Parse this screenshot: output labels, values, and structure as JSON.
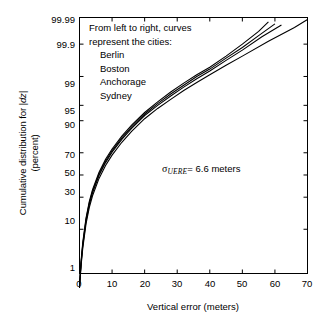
{
  "chart_data": {
    "type": "line",
    "title": "",
    "xlabel": "Vertical error (meters)",
    "ylabel_line1": "Cumulative distribution for |dz|",
    "ylabel_line2": "(percent)",
    "ylabel_italic_part": "|dz|",
    "xlim": [
      0,
      70
    ],
    "xticks": [
      0,
      10,
      20,
      30,
      40,
      50,
      60,
      70
    ],
    "xtick_labels": [
      "0",
      "10",
      "20",
      "30",
      "40",
      "50",
      "60",
      "70"
    ],
    "yscale": "normal-probability",
    "ylim": [
      1,
      99.99
    ],
    "yticks": [
      1,
      10,
      30,
      50,
      70,
      90,
      95,
      99,
      99.9,
      99.99
    ],
    "ytick_labels": [
      "1",
      "10",
      "30",
      "50",
      "70",
      "90",
      "95",
      "99",
      "99.9",
      "99.99"
    ],
    "grid": false,
    "legend_position": "inside-top-left-as-text",
    "annotations": [
      {
        "name": "curve-order-note",
        "lines": [
          "From left to right, curves",
          "represent the cities:",
          "Berlin",
          "Boston",
          "Anchorage",
          "Sydney"
        ]
      },
      {
        "name": "sigma-uere",
        "symbol": "σ",
        "subscript": "UERE",
        "equals": "= 6.6 meters",
        "full_text": "σUERE = 6.6 meters"
      }
    ],
    "series": [
      {
        "name": "Berlin",
        "color": "#000000",
        "x": [
          0,
          0.5,
          1,
          2,
          3,
          4,
          6,
          8,
          10,
          13,
          16,
          20,
          24,
          28,
          32,
          36,
          40,
          45,
          50,
          55,
          58
        ],
        "y": [
          0.5,
          2.2,
          5.5,
          15.5,
          26.5,
          36.5,
          52.5,
          64.5,
          73.0,
          82.0,
          88.0,
          93.0,
          95.8,
          97.5,
          98.5,
          99.1,
          99.45,
          99.75,
          99.9,
          99.965,
          99.985
        ]
      },
      {
        "name": "Boston",
        "color": "#000000",
        "x": [
          0,
          0.5,
          1,
          2,
          3,
          4,
          6,
          8,
          10,
          13,
          16,
          20,
          24,
          28,
          32,
          36,
          40,
          45,
          50,
          55,
          60
        ],
        "y": [
          0.45,
          2.0,
          5.1,
          14.6,
          25.3,
          35.1,
          51.0,
          63.0,
          71.8,
          81.0,
          87.2,
          92.5,
          95.4,
          97.2,
          98.3,
          99.0,
          99.38,
          99.71,
          99.87,
          99.95,
          99.982
        ]
      },
      {
        "name": "Anchorage",
        "color": "#000000",
        "x": [
          0,
          0.5,
          1,
          2,
          3,
          4,
          6,
          8,
          10,
          13,
          16,
          20,
          24,
          28,
          32,
          36,
          40,
          45,
          50,
          56,
          62
        ],
        "y": [
          0.42,
          1.85,
          4.7,
          13.7,
          24.0,
          33.6,
          49.5,
          61.5,
          70.5,
          80.0,
          86.4,
          92.0,
          95.0,
          96.9,
          98.1,
          98.85,
          99.3,
          99.66,
          99.84,
          99.945,
          99.98
        ]
      },
      {
        "name": "Sydney",
        "color": "#000000",
        "x": [
          0,
          0.5,
          1,
          2,
          3,
          4,
          6,
          8,
          10,
          13,
          16,
          20,
          24,
          28,
          32,
          36,
          40,
          45,
          50,
          58,
          66,
          70
        ],
        "y": [
          0.38,
          1.65,
          4.2,
          12.4,
          22.0,
          31.2,
          46.8,
          58.8,
          68.0,
          78.0,
          84.8,
          90.8,
          94.2,
          96.3,
          97.7,
          98.55,
          99.1,
          99.52,
          99.75,
          99.92,
          99.975,
          99.988
        ]
      }
    ]
  },
  "plot": {
    "frame_color": "#000000",
    "background": "#ffffff"
  }
}
